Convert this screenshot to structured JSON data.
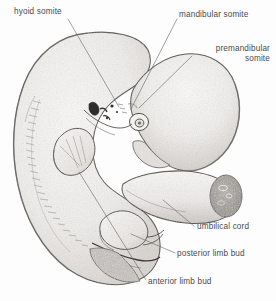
{
  "figure": {
    "medium": "pen-and-ink stipple anatomical drawing",
    "background_color": "#fdfdfd",
    "ink_color": "#3a3a3a",
    "label_color": "#4a4a4a",
    "body_fill_color": "#f2f1ef",
    "shade_color": "#c9c6c2",
    "cut_face_color": "#a9a5a0",
    "width": 276,
    "height": 301
  },
  "labels": [
    {
      "id": "hyoid-somite",
      "text": "hyoid somite",
      "lines": [
        "hyoid somite"
      ],
      "align": "left",
      "x": 14,
      "y": 7,
      "leader_from": [
        68,
        19
      ],
      "leader_to": [
        119,
        107
      ]
    },
    {
      "id": "mandibular-somite",
      "text": "mandibular somite",
      "lines": [
        "mandibular somite"
      ],
      "align": "left",
      "x": 179,
      "y": 10,
      "leader_from": [
        177,
        19
      ],
      "leader_to": [
        131,
        109
      ]
    },
    {
      "id": "premandibular-somite",
      "text": "premandibular somite",
      "lines": [
        "premandibular",
        "somite"
      ],
      "align": "right",
      "x": 194,
      "y": 44,
      "leader_from": [
        192,
        56
      ],
      "leader_to": [
        139,
        108
      ]
    },
    {
      "id": "umbilical-cord",
      "text": "umbilical cord",
      "lines": [
        "umbilical cord"
      ],
      "align": "left",
      "x": 197,
      "y": 222,
      "leader_from": [
        194,
        226
      ],
      "leader_to": [
        163,
        200
      ]
    },
    {
      "id": "posterior-limb-bud",
      "text": "posterior limb bud",
      "lines": [
        "posterior limb bud"
      ],
      "align": "left",
      "x": 177,
      "y": 249,
      "leader_from": [
        175,
        253
      ],
      "leader_to": [
        131,
        234
      ]
    },
    {
      "id": "anterior-limb-bud",
      "text": "anterior limb bud",
      "lines": [
        "anterior limb bud"
      ],
      "align": "left",
      "x": 148,
      "y": 277,
      "leader_from": [
        146,
        280
      ],
      "leader_to": [
        79,
        172
      ]
    }
  ],
  "structures": [
    {
      "id": "head",
      "name": "head / prosencephalon"
    },
    {
      "id": "trunk",
      "name": "curved trunk with somite series"
    },
    {
      "id": "tail",
      "name": "tail"
    },
    {
      "id": "anterior-limb-bud",
      "name": "anterior limb bud"
    },
    {
      "id": "posterior-limb-bud",
      "name": "posterior limb bud"
    },
    {
      "id": "umbilical-cord",
      "name": "umbilical cord with cut face"
    },
    {
      "id": "optic-vesicle",
      "name": "optic vesicle (eye)"
    },
    {
      "id": "pharyngeal-arches",
      "name": "pharyngeal arches"
    },
    {
      "id": "somite-series",
      "name": "segmented somite series along dorsal trunk"
    }
  ]
}
